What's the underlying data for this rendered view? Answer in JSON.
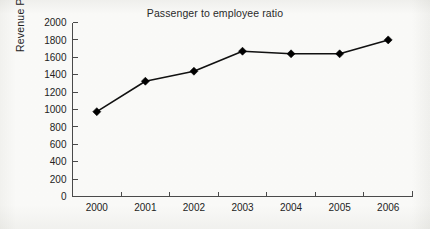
{
  "chart_data": {
    "type": "line",
    "title": "Passenger to employee ratio",
    "xlabel": "",
    "ylabel": "Revenue Passengers",
    "categories": [
      "2000",
      "2001",
      "2002",
      "2003",
      "2004",
      "2005",
      "2006"
    ],
    "x": [
      2000,
      2001,
      2002,
      2003,
      2004,
      2005,
      2006
    ],
    "values": [
      975,
      1325,
      1440,
      1670,
      1640,
      1640,
      1800
    ],
    "series": [
      {
        "name": "Revenue Passengers",
        "values": [
          975,
          1325,
          1440,
          1670,
          1640,
          1640,
          1800
        ]
      }
    ],
    "ylim": [
      0,
      2000
    ],
    "yticks": [
      0,
      200,
      400,
      600,
      800,
      1000,
      1200,
      1400,
      1600,
      1800,
      2000
    ],
    "ytick_labels": [
      "0",
      "200",
      "400",
      "600",
      "800",
      "1000",
      "1200",
      "1400",
      "1600",
      "1800",
      "2000"
    ],
    "xtick_labels": [
      "2000",
      "2001",
      "2002",
      "2003",
      "2004",
      "2005",
      "2006"
    ],
    "grid": false,
    "legend": false,
    "legend_position": "none",
    "marker": "diamond",
    "line_color": "#111111",
    "marker_color": "#000000",
    "background_color": "#fbfbfa",
    "axis_color": "#4a4a4a"
  }
}
